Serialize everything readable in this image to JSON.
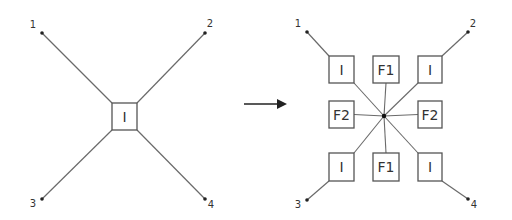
{
  "colors": {
    "line": "#6a6a6a",
    "box_stroke": "#555555",
    "text": "#333333",
    "arrow": "#222222",
    "background": "#ffffff"
  },
  "left_diagram": {
    "terminals": [
      {
        "id": "1",
        "label": "1",
        "x": 42,
        "y": 33,
        "lx": 33,
        "ly": 28
      },
      {
        "id": "2",
        "label": "2",
        "x": 205,
        "y": 33,
        "lx": 210,
        "ly": 27
      },
      {
        "id": "3",
        "label": "3",
        "x": 42,
        "y": 199,
        "lx": 33,
        "ly": 207
      },
      {
        "id": "4",
        "label": "4",
        "x": 205,
        "y": 199,
        "lx": 211,
        "ly": 208
      }
    ],
    "center_box": {
      "label": "I",
      "x": 112,
      "y": 103,
      "w": 25,
      "h": 27
    }
  },
  "arrow": {
    "x1": 244,
    "y1": 104,
    "x2": 285,
    "y2": 104,
    "direction": "right"
  },
  "right_diagram": {
    "center": {
      "x": 384,
      "y": 116
    },
    "terminals": [
      {
        "id": "1",
        "label": "1",
        "x": 307,
        "y": 32,
        "lx": 298,
        "ly": 27
      },
      {
        "id": "2",
        "label": "2",
        "x": 468,
        "y": 32,
        "lx": 473,
        "ly": 27
      },
      {
        "id": "3",
        "label": "3",
        "x": 307,
        "y": 200,
        "lx": 298,
        "ly": 208
      },
      {
        "id": "4",
        "label": "4",
        "x": 468,
        "y": 199,
        "lx": 474,
        "ly": 208
      }
    ],
    "boxes": [
      {
        "id": "I-top-left",
        "label": "I",
        "x": 329,
        "y": 56,
        "w": 25,
        "h": 27
      },
      {
        "id": "F1-top",
        "label": "F1",
        "x": 373,
        "y": 56,
        "w": 26,
        "h": 27
      },
      {
        "id": "I-top-right",
        "label": "I",
        "x": 418,
        "y": 56,
        "w": 24,
        "h": 27
      },
      {
        "id": "F2-left",
        "label": "F2",
        "x": 329,
        "y": 101,
        "w": 25,
        "h": 27
      },
      {
        "id": "F2-right",
        "label": "F2",
        "x": 418,
        "y": 101,
        "w": 24,
        "h": 27
      },
      {
        "id": "I-bottom-left",
        "label": "I",
        "x": 329,
        "y": 153,
        "w": 25,
        "h": 28
      },
      {
        "id": "F1-bottom",
        "label": "F1",
        "x": 373,
        "y": 153,
        "w": 26,
        "h": 28
      },
      {
        "id": "I-bottom-right",
        "label": "I",
        "x": 418,
        "y": 153,
        "w": 24,
        "h": 28
      }
    ]
  }
}
